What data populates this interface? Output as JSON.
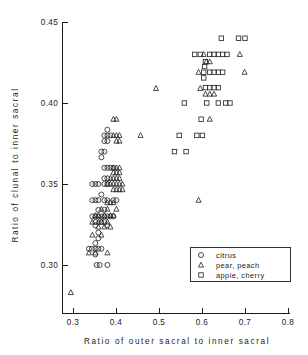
{
  "chart_data": {
    "type": "scatter",
    "title": "",
    "xlabel": "Ratio  of  outer  sacral  to  inner  sacral",
    "ylabel": "Ratio  of  clunal  to  inner  sacral",
    "xlim": [
      0.28,
      0.8
    ],
    "ylim": [
      0.275,
      0.45
    ],
    "grid": false,
    "xticks": [
      "0.3",
      "0.4",
      "0.5",
      "0.6",
      "0.7",
      "0.8"
    ],
    "xtick_values": [
      0.3,
      0.4,
      0.5,
      0.6,
      0.7,
      0.8
    ],
    "yticks": [
      "0.30",
      "0.35",
      "0.40",
      "0.45"
    ],
    "ytick_values": [
      0.3,
      0.35,
      0.4,
      0.45
    ],
    "legend_position": "lower-right",
    "series": [
      {
        "name": "citrus",
        "marker": "circle",
        "points": [
          [
            0.355,
            0.3
          ],
          [
            0.362,
            0.3
          ],
          [
            0.38,
            0.3
          ],
          [
            0.337,
            0.31
          ],
          [
            0.344,
            0.31
          ],
          [
            0.352,
            0.31
          ],
          [
            0.359,
            0.31
          ],
          [
            0.366,
            0.31
          ],
          [
            0.352,
            0.3135
          ],
          [
            0.352,
            0.3065
          ],
          [
            0.359,
            0.32
          ],
          [
            0.359,
            0.3165
          ],
          [
            0.352,
            0.3245
          ],
          [
            0.379,
            0.3245
          ],
          [
            0.345,
            0.33
          ],
          [
            0.352,
            0.33
          ],
          [
            0.359,
            0.33
          ],
          [
            0.366,
            0.33
          ],
          [
            0.373,
            0.33
          ],
          [
            0.38,
            0.33
          ],
          [
            0.387,
            0.33
          ],
          [
            0.394,
            0.33
          ],
          [
            0.352,
            0.3265
          ],
          [
            0.366,
            0.3265
          ],
          [
            0.373,
            0.3265
          ],
          [
            0.359,
            0.334
          ],
          [
            0.373,
            0.334
          ],
          [
            0.345,
            0.34
          ],
          [
            0.352,
            0.34
          ],
          [
            0.359,
            0.34
          ],
          [
            0.373,
            0.34
          ],
          [
            0.38,
            0.34
          ],
          [
            0.394,
            0.34
          ],
          [
            0.401,
            0.34
          ],
          [
            0.366,
            0.3435
          ],
          [
            0.345,
            0.35
          ],
          [
            0.352,
            0.35
          ],
          [
            0.359,
            0.35
          ],
          [
            0.373,
            0.35
          ],
          [
            0.38,
            0.35
          ],
          [
            0.373,
            0.3535
          ],
          [
            0.38,
            0.3535
          ],
          [
            0.373,
            0.36
          ],
          [
            0.38,
            0.36
          ],
          [
            0.387,
            0.36
          ],
          [
            0.394,
            0.36
          ],
          [
            0.366,
            0.3665
          ],
          [
            0.366,
            0.37
          ],
          [
            0.373,
            0.37
          ],
          [
            0.373,
            0.3765
          ],
          [
            0.38,
            0.3765
          ],
          [
            0.373,
            0.38
          ],
          [
            0.38,
            0.38
          ],
          [
            0.387,
            0.38
          ],
          [
            0.38,
            0.3835
          ]
        ]
      },
      {
        "name": "pear, peach",
        "marker": "triangle",
        "points": [
          [
            0.295,
            0.283
          ],
          [
            0.337,
            0.3075
          ],
          [
            0.352,
            0.3075
          ],
          [
            0.38,
            0.3075
          ],
          [
            0.345,
            0.3185
          ],
          [
            0.366,
            0.3185
          ],
          [
            0.359,
            0.3235
          ],
          [
            0.373,
            0.3235
          ],
          [
            0.387,
            0.3235
          ],
          [
            0.345,
            0.3265
          ],
          [
            0.359,
            0.3265
          ],
          [
            0.366,
            0.3265
          ],
          [
            0.38,
            0.3265
          ],
          [
            0.352,
            0.3305
          ],
          [
            0.359,
            0.3305
          ],
          [
            0.373,
            0.3305
          ],
          [
            0.387,
            0.3305
          ],
          [
            0.394,
            0.3305
          ],
          [
            0.366,
            0.3345
          ],
          [
            0.38,
            0.3345
          ],
          [
            0.401,
            0.3345
          ],
          [
            0.38,
            0.3385
          ],
          [
            0.387,
            0.3385
          ],
          [
            0.394,
            0.3385
          ],
          [
            0.394,
            0.3465
          ],
          [
            0.401,
            0.3465
          ],
          [
            0.408,
            0.3465
          ],
          [
            0.415,
            0.3465
          ],
          [
            0.38,
            0.35
          ],
          [
            0.387,
            0.35
          ],
          [
            0.394,
            0.35
          ],
          [
            0.401,
            0.35
          ],
          [
            0.408,
            0.35
          ],
          [
            0.415,
            0.35
          ],
          [
            0.387,
            0.3535
          ],
          [
            0.394,
            0.3535
          ],
          [
            0.401,
            0.3535
          ],
          [
            0.408,
            0.3535
          ],
          [
            0.394,
            0.357
          ],
          [
            0.401,
            0.357
          ],
          [
            0.408,
            0.357
          ],
          [
            0.394,
            0.36
          ],
          [
            0.401,
            0.36
          ],
          [
            0.408,
            0.36
          ],
          [
            0.401,
            0.3765
          ],
          [
            0.408,
            0.3765
          ],
          [
            0.394,
            0.38
          ],
          [
            0.401,
            0.38
          ],
          [
            0.408,
            0.38
          ],
          [
            0.457,
            0.38
          ],
          [
            0.394,
            0.39
          ],
          [
            0.401,
            0.39
          ],
          [
            0.493,
            0.409
          ],
          [
            0.592,
            0.34
          ],
          [
            0.618,
            0.39
          ],
          [
            0.596,
            0.409
          ],
          [
            0.608,
            0.4055
          ],
          [
            0.618,
            0.4055
          ],
          [
            0.628,
            0.4055
          ],
          [
            0.592,
            0.419
          ],
          [
            0.699,
            0.419
          ],
          [
            0.61,
            0.4255
          ],
          [
            0.618,
            0.4255
          ],
          [
            0.604,
            0.43
          ],
          [
            0.688,
            0.43
          ]
        ]
      },
      {
        "name": "apple, cherry",
        "marker": "square",
        "points": [
          [
            0.645,
            0.44
          ],
          [
            0.685,
            0.44
          ],
          [
            0.7,
            0.44
          ],
          [
            0.583,
            0.43
          ],
          [
            0.596,
            0.43
          ],
          [
            0.618,
            0.43
          ],
          [
            0.628,
            0.43
          ],
          [
            0.638,
            0.43
          ],
          [
            0.648,
            0.43
          ],
          [
            0.658,
            0.43
          ],
          [
            0.608,
            0.4255
          ],
          [
            0.606,
            0.4225
          ],
          [
            0.604,
            0.419
          ],
          [
            0.618,
            0.419
          ],
          [
            0.628,
            0.419
          ],
          [
            0.638,
            0.419
          ],
          [
            0.648,
            0.419
          ],
          [
            0.604,
            0.4155
          ],
          [
            0.608,
            0.4095
          ],
          [
            0.618,
            0.4095
          ],
          [
            0.628,
            0.4095
          ],
          [
            0.638,
            0.4095
          ],
          [
            0.559,
            0.4
          ],
          [
            0.611,
            0.4
          ],
          [
            0.638,
            0.4
          ],
          [
            0.655,
            0.4
          ],
          [
            0.665,
            0.4
          ],
          [
            0.598,
            0.39
          ],
          [
            0.547,
            0.38
          ],
          [
            0.588,
            0.38
          ],
          [
            0.601,
            0.38
          ],
          [
            0.536,
            0.37
          ],
          [
            0.563,
            0.37
          ]
        ]
      }
    ]
  },
  "legend": {
    "entries": [
      {
        "label": "citrus",
        "marker": "circle-icon"
      },
      {
        "label": "pear,  peach",
        "marker": "triangle-icon"
      },
      {
        "label": "apple,  cherry",
        "marker": "square-icon"
      }
    ]
  },
  "colors": {
    "axis": "#1a1a1a",
    "marker": "#2b2b2b",
    "background": "#ffffff"
  }
}
